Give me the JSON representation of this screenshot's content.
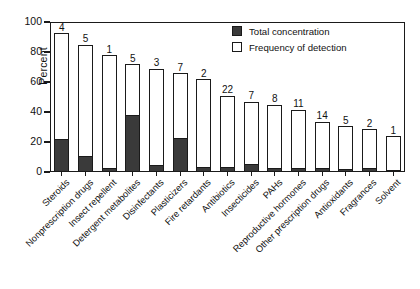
{
  "chart_data": {
    "type": "bar",
    "title": "",
    "subtitle": "",
    "xlabel": "",
    "ylabel": "Percent",
    "ylim": [
      0,
      100
    ],
    "yticks": [
      0,
      20,
      40,
      60,
      80,
      100
    ],
    "ytick_labels": [
      "0",
      "20",
      "40",
      "60",
      "80",
      "100"
    ],
    "grid": false,
    "stacked": true,
    "legend_position": "top-right",
    "legend": [
      "Total concentration",
      "Frequency of detection"
    ],
    "categories": [
      "Steroids",
      "Nonprescription drugs",
      "Insect repellent",
      "Detergent metabolites",
      "Disinfectants",
      "Plasticizers",
      "Fire retardants",
      "Antibiotics",
      "Insecticides",
      "PAHs",
      "Reproductive hormones",
      "Other prescription drugs",
      "Antioxidants",
      "Fragrances",
      "Solvent"
    ],
    "series": [
      {
        "name": "Frequency of detection",
        "values": [
          92.5,
          85,
          78,
          72,
          69,
          66,
          62,
          51,
          47,
          45,
          41.5,
          33.5,
          30.5,
          28.5,
          24
        ]
      },
      {
        "name": "Total concentration",
        "values": [
          21.5,
          10,
          2,
          37.5,
          4,
          22,
          2.5,
          3,
          5,
          2,
          2,
          2,
          1.5,
          2,
          1
        ]
      }
    ],
    "bar_count_labels": [
      "4",
      "5",
      "1",
      "5",
      "3",
      "7",
      "2",
      "22",
      "7",
      "8",
      "11",
      "14",
      "5",
      "2",
      "1"
    ],
    "colors": {
      "total_concentration": "#3a3a3a",
      "frequency_of_detection": "#ffffff",
      "axis": "#1a1a1a",
      "background": "#ffffff"
    }
  },
  "axis": {
    "y_title": "Percent"
  }
}
